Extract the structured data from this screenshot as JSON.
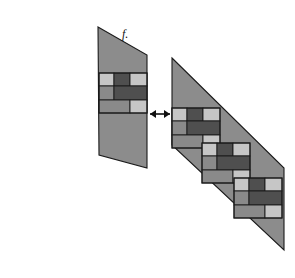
{
  "figure": {
    "label": "f.",
    "label_x": 122,
    "label_y": 38,
    "background_color": "#ffffff",
    "panel_color": "#8c8c8c",
    "outline_color": "#1a1a1a",
    "tile_colors": {
      "light": "#c6c6c6",
      "mid": "#8a8a8a",
      "dark": "#4f4f4f"
    },
    "relation_symbol": "double-headed-arrow"
  },
  "arrow": {
    "name": "equivalence-arrow",
    "x1": 150,
    "x2": 170,
    "y": 114,
    "heads": "both"
  },
  "left_panel": {
    "name": "left-parallelogram",
    "points": "98,27 147,55 147,168 99,155",
    "block_count": 1,
    "blocks": [
      {
        "x": 99,
        "y": 73,
        "w": 48,
        "h": 40
      }
    ]
  },
  "right_panel": {
    "name": "right-parallelogram",
    "points": "172,58 284,168 284,250 172,145",
    "block_count": 3,
    "blocks": [
      {
        "x": 172,
        "y": 108,
        "w": 48,
        "h": 40
      },
      {
        "x": 202,
        "y": 143,
        "w": 48,
        "h": 40
      },
      {
        "x": 234,
        "y": 178,
        "w": 48,
        "h": 40
      }
    ]
  },
  "block_pattern": {
    "name": "brick-tile-pattern",
    "description": "three-row brick motif",
    "grid_width": 48,
    "grid_height": 40,
    "rows": [
      {
        "row": 1,
        "y": 0,
        "h": 13,
        "cells": [
          {
            "x": 0,
            "w": 15,
            "shade": "light"
          },
          {
            "x": 15,
            "w": 16,
            "shade": "dark"
          },
          {
            "x": 31,
            "w": 17,
            "shade": "light"
          }
        ]
      },
      {
        "row": 2,
        "y": 13,
        "h": 14,
        "cells": [
          {
            "x": 0,
            "w": 15,
            "shade": "mid"
          },
          {
            "x": 15,
            "w": 33,
            "shade": "dark"
          }
        ]
      },
      {
        "row": 3,
        "y": 27,
        "h": 13,
        "cells": [
          {
            "x": 0,
            "w": 31,
            "shade": "mid"
          },
          {
            "x": 31,
            "w": 17,
            "shade": "light"
          }
        ]
      }
    ]
  }
}
